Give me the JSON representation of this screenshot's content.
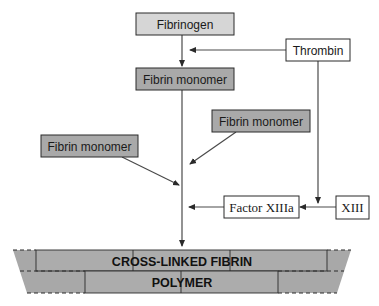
{
  "diagram": {
    "colors": {
      "fibrinogen_fill": "#d6d6d6",
      "monomer_fill": "#a9a9a9",
      "enzyme_fill": "#ffffff",
      "polymer_fill": "#a8a8a8",
      "stroke": "#2a2a2a"
    },
    "nodes": {
      "fibrinogen": {
        "label": "Fibrinogen"
      },
      "thrombin": {
        "label": "Thrombin"
      },
      "fibrin_monomer_center": {
        "label": "Fibrin monomer"
      },
      "fibrin_monomer_right": {
        "label": "Fibrin monomer"
      },
      "fibrin_monomer_left": {
        "label": "Fibrin monomer"
      },
      "factor_xiiia": {
        "label": "Factor XIIIa"
      },
      "xiii": {
        "label": "XIII"
      }
    },
    "polymer": {
      "line1": "CROSS-LINKED FIBRIN",
      "line2": "POLYMER"
    },
    "edges": [
      {
        "from": "fibrinogen",
        "to": "fibrin_monomer_center"
      },
      {
        "from": "thrombin",
        "to": "fibrinogen->fibrin_monomer_center"
      },
      {
        "from": "thrombin",
        "to": "xiii->factor_xiiia"
      },
      {
        "from": "xiii",
        "to": "factor_xiiia"
      },
      {
        "from": "fibrin_monomer_center",
        "to": "polymer"
      },
      {
        "from": "fibrin_monomer_right",
        "to": "polymer-chain"
      },
      {
        "from": "fibrin_monomer_left",
        "to": "polymer-chain"
      },
      {
        "from": "factor_xiiia",
        "to": "polymer-chain"
      }
    ]
  }
}
